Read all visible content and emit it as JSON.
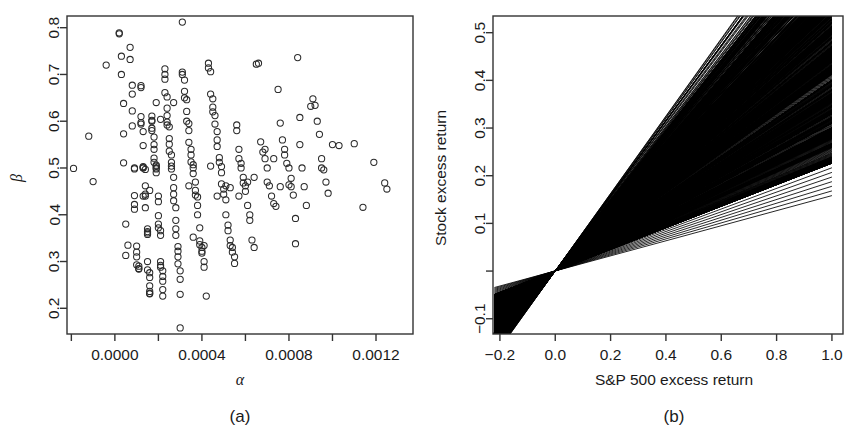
{
  "figure": {
    "background": "#ffffff",
    "ink": "#1a1a1a",
    "panels": [
      {
        "id": "a",
        "subcaption": "(a)",
        "xlabel": "α",
        "ylabel": "β",
        "xticks": [
          "0.0000",
          "0.0004",
          "0.0008",
          "0.0012"
        ],
        "yticks": [
          "0.2",
          "0.3",
          "0.4",
          "0.5",
          "0.6",
          "0.7",
          "0.8"
        ]
      },
      {
        "id": "b",
        "subcaption": "(b)",
        "xlabel": "S&P 500 excess return",
        "ylabel": "Stock excess return",
        "xticks": [
          "-0.2",
          "0.0",
          "0.2",
          "0.4",
          "0.6",
          "0.8",
          "1.0"
        ],
        "yticks": [
          "-0.1",
          "0.1",
          "0.2",
          "0.3",
          "0.4",
          "0.5"
        ]
      }
    ]
  },
  "chart_data": [
    {
      "type": "scatter",
      "panel": "(a)",
      "title": "",
      "xlabel": "α",
      "ylabel": "β",
      "xlim": [
        -0.00022,
        0.00137
      ],
      "ylim": [
        0.145,
        0.825
      ],
      "xticks": [
        0.0,
        0.0004,
        0.0008,
        0.0012
      ],
      "xtick_labels": [
        "0.0000",
        "0.0004",
        "0.0008",
        "0.0012"
      ],
      "yticks": [
        0.2,
        0.3,
        0.4,
        0.5,
        0.6,
        0.7,
        0.8
      ],
      "ytick_labels": [
        "0.2",
        "0.3",
        "0.4",
        "0.5",
        "0.6",
        "0.7",
        "0.8"
      ],
      "grid": false,
      "legend": "none",
      "marker": "open-circle",
      "n_points": 260,
      "points": [
        [
          -0.00019,
          0.499
        ],
        [
          -0.00012,
          0.568
        ],
        [
          -0.0001,
          0.471
        ],
        [
          -4e-05,
          0.72
        ],
        [
          2e-05,
          0.787
        ],
        [
          2e-05,
          0.789
        ],
        [
          3e-05,
          0.7
        ],
        [
          3e-05,
          0.739
        ],
        [
          4e-05,
          0.638
        ],
        [
          4e-05,
          0.573
        ],
        [
          4e-05,
          0.511
        ],
        [
          5e-05,
          0.38
        ],
        [
          5e-05,
          0.313
        ],
        [
          6e-05,
          0.335
        ],
        [
          7e-05,
          0.758
        ],
        [
          7e-05,
          0.732
        ],
        [
          8e-05,
          0.677
        ],
        [
          8e-05,
          0.658
        ],
        [
          8e-05,
          0.622
        ],
        [
          8e-05,
          0.59
        ],
        [
          9e-05,
          0.5
        ],
        [
          9e-05,
          0.498
        ],
        [
          9e-05,
          0.441
        ],
        [
          9e-05,
          0.422
        ],
        [
          9e-05,
          0.412
        ],
        [
          0.0001,
          0.333
        ],
        [
          0.0001,
          0.32
        ],
        [
          0.0001,
          0.31
        ],
        [
          0.0001,
          0.293
        ],
        [
          0.00011,
          0.29
        ],
        [
          0.00011,
          0.285
        ],
        [
          0.00011,
          0.284
        ],
        [
          0.00012,
          0.676
        ],
        [
          0.00012,
          0.672
        ],
        [
          0.00012,
          0.61
        ],
        [
          0.00012,
          0.597
        ],
        [
          0.00012,
          0.594
        ],
        [
          0.00013,
          0.578
        ],
        [
          0.00013,
          0.548
        ],
        [
          0.00013,
          0.503
        ],
        [
          0.00013,
          0.501
        ],
        [
          0.00013,
          0.5
        ],
        [
          0.00014,
          0.497
        ],
        [
          0.00014,
          0.462
        ],
        [
          0.00014,
          0.444
        ],
        [
          0.00014,
          0.44
        ],
        [
          0.00014,
          0.415
        ],
        [
          0.00015,
          0.37
        ],
        [
          0.00015,
          0.364
        ],
        [
          0.00015,
          0.361
        ],
        [
          0.00015,
          0.358
        ],
        [
          0.00015,
          0.3
        ],
        [
          0.00015,
          0.282
        ],
        [
          0.00016,
          0.276
        ],
        [
          0.00016,
          0.266
        ],
        [
          0.00016,
          0.248
        ],
        [
          0.00016,
          0.236
        ],
        [
          0.00016,
          0.232
        ],
        [
          0.00016,
          0.231
        ],
        [
          0.00017,
          0.611
        ],
        [
          0.00017,
          0.602
        ],
        [
          0.00017,
          0.6
        ],
        [
          0.00017,
          0.585
        ],
        [
          0.00017,
          0.58
        ],
        [
          0.00018,
          0.566
        ],
        [
          0.00018,
          0.55
        ],
        [
          0.00018,
          0.54
        ],
        [
          0.00018,
          0.521
        ],
        [
          0.00018,
          0.512
        ],
        [
          0.00019,
          0.506
        ],
        [
          0.00019,
          0.504
        ],
        [
          0.00019,
          0.5
        ],
        [
          0.00019,
          0.498
        ],
        [
          0.00019,
          0.49
        ],
        [
          0.0002,
          0.44
        ],
        [
          0.0002,
          0.428
        ],
        [
          0.0002,
          0.398
        ],
        [
          0.0002,
          0.38
        ],
        [
          0.0002,
          0.372
        ],
        [
          0.00021,
          0.366
        ],
        [
          0.00021,
          0.356
        ],
        [
          0.00021,
          0.3
        ],
        [
          0.00021,
          0.292
        ],
        [
          0.00021,
          0.288
        ],
        [
          0.00022,
          0.28
        ],
        [
          0.00022,
          0.268
        ],
        [
          0.00022,
          0.258
        ],
        [
          0.00022,
          0.24
        ],
        [
          0.00022,
          0.226
        ],
        [
          0.00023,
          0.7
        ],
        [
          0.00023,
          0.69
        ],
        [
          0.00023,
          0.712
        ],
        [
          0.00023,
          0.661
        ],
        [
          0.00024,
          0.652
        ],
        [
          0.00024,
          0.612
        ],
        [
          0.00024,
          0.598
        ],
        [
          0.00024,
          0.592
        ],
        [
          0.00025,
          0.588
        ],
        [
          0.00025,
          0.563
        ],
        [
          0.00025,
          0.551
        ],
        [
          0.00025,
          0.536
        ],
        [
          0.00026,
          0.528
        ],
        [
          0.00026,
          0.512
        ],
        [
          0.00026,
          0.504
        ],
        [
          0.00026,
          0.498
        ],
        [
          0.00027,
          0.48
        ],
        [
          0.00027,
          0.458
        ],
        [
          0.00027,
          0.444
        ],
        [
          0.00027,
          0.43
        ],
        [
          0.00028,
          0.415
        ],
        [
          0.00028,
          0.388
        ],
        [
          0.00028,
          0.37
        ],
        [
          0.00028,
          0.356
        ],
        [
          0.00029,
          0.332
        ],
        [
          0.00029,
          0.322
        ],
        [
          0.00029,
          0.31
        ],
        [
          0.00029,
          0.295
        ],
        [
          0.0003,
          0.28
        ],
        [
          0.0003,
          0.262
        ],
        [
          0.0003,
          0.23
        ],
        [
          0.00031,
          0.812
        ],
        [
          0.00031,
          0.705
        ],
        [
          0.00031,
          0.7
        ],
        [
          0.00032,
          0.688
        ],
        [
          0.00032,
          0.664
        ],
        [
          0.00032,
          0.65
        ],
        [
          0.00033,
          0.646
        ],
        [
          0.00033,
          0.621
        ],
        [
          0.00033,
          0.6
        ],
        [
          0.00034,
          0.595
        ],
        [
          0.00034,
          0.58
        ],
        [
          0.00034,
          0.555
        ],
        [
          0.00035,
          0.54
        ],
        [
          0.00035,
          0.528
        ],
        [
          0.00035,
          0.513
        ],
        [
          0.00036,
          0.507
        ],
        [
          0.00036,
          0.5
        ],
        [
          0.00036,
          0.488
        ],
        [
          0.00037,
          0.47
        ],
        [
          0.00037,
          0.452
        ],
        [
          0.00037,
          0.442
        ],
        [
          0.00038,
          0.438
        ],
        [
          0.00038,
          0.42
        ],
        [
          0.00038,
          0.4
        ],
        [
          0.00039,
          0.372
        ],
        [
          0.00039,
          0.344
        ],
        [
          0.00039,
          0.336
        ],
        [
          0.0004,
          0.33
        ],
        [
          0.0004,
          0.322
        ],
        [
          0.0004,
          0.318
        ],
        [
          0.00041,
          0.3
        ],
        [
          0.00041,
          0.288
        ],
        [
          0.00042,
          0.226
        ],
        [
          0.00043,
          0.724
        ],
        [
          0.00043,
          0.714
        ],
        [
          0.00044,
          0.706
        ],
        [
          0.00044,
          0.658
        ],
        [
          0.00045,
          0.648
        ],
        [
          0.00045,
          0.63
        ],
        [
          0.00045,
          0.62
        ],
        [
          0.00046,
          0.612
        ],
        [
          0.00046,
          0.594
        ],
        [
          0.00047,
          0.578
        ],
        [
          0.00047,
          0.56
        ],
        [
          0.00047,
          0.546
        ],
        [
          0.00048,
          0.522
        ],
        [
          0.00048,
          0.512
        ],
        [
          0.00049,
          0.503
        ],
        [
          0.00049,
          0.49
        ],
        [
          0.00049,
          0.466
        ],
        [
          0.0005,
          0.455
        ],
        [
          0.0005,
          0.444
        ],
        [
          0.00051,
          0.432
        ],
        [
          0.00051,
          0.4
        ],
        [
          0.00052,
          0.378
        ],
        [
          0.00052,
          0.366
        ],
        [
          0.00053,
          0.346
        ],
        [
          0.00053,
          0.334
        ],
        [
          0.00054,
          0.33
        ],
        [
          0.00054,
          0.32
        ],
        [
          0.00055,
          0.31
        ],
        [
          0.00055,
          0.296
        ],
        [
          0.00056,
          0.592
        ],
        [
          0.00056,
          0.58
        ],
        [
          0.00057,
          0.54
        ],
        [
          0.00057,
          0.52
        ],
        [
          0.00058,
          0.51
        ],
        [
          0.00058,
          0.5
        ],
        [
          0.00059,
          0.48
        ],
        [
          0.00059,
          0.468
        ],
        [
          0.0006,
          0.462
        ],
        [
          0.0006,
          0.45
        ],
        [
          0.00061,
          0.42
        ],
        [
          0.00062,
          0.4
        ],
        [
          0.00062,
          0.388
        ],
        [
          0.00063,
          0.346
        ],
        [
          0.00064,
          0.33
        ],
        [
          0.00065,
          0.722
        ],
        [
          0.00066,
          0.724
        ],
        [
          0.00067,
          0.556
        ],
        [
          0.00068,
          0.534
        ],
        [
          0.00069,
          0.52
        ],
        [
          0.0007,
          0.5
        ],
        [
          0.0007,
          0.47
        ],
        [
          0.00071,
          0.462
        ],
        [
          0.00072,
          0.44
        ],
        [
          0.00073,
          0.424
        ],
        [
          0.00074,
          0.418
        ],
        [
          0.00075,
          0.668
        ],
        [
          0.00076,
          0.596
        ],
        [
          0.00077,
          0.56
        ],
        [
          0.00078,
          0.54
        ],
        [
          0.00078,
          0.528
        ],
        [
          0.00079,
          0.51
        ],
        [
          0.0008,
          0.5
        ],
        [
          0.00081,
          0.478
        ],
        [
          0.00081,
          0.46
        ],
        [
          0.00082,
          0.442
        ],
        [
          0.00083,
          0.392
        ],
        [
          0.00083,
          0.338
        ],
        [
          0.00084,
          0.736
        ],
        [
          0.00085,
          0.55
        ],
        [
          0.00086,
          0.5
        ],
        [
          0.00087,
          0.46
        ],
        [
          0.00088,
          0.42
        ],
        [
          0.0009,
          0.632
        ],
        [
          0.00091,
          0.648
        ],
        [
          0.00092,
          0.634
        ],
        [
          0.00093,
          0.6
        ],
        [
          0.00094,
          0.572
        ],
        [
          0.00095,
          0.52
        ],
        [
          0.00095,
          0.5
        ],
        [
          0.00096,
          0.496
        ],
        [
          0.00097,
          0.47
        ],
        [
          0.00098,
          0.446
        ],
        [
          0.001,
          0.55
        ],
        [
          0.00103,
          0.548
        ],
        [
          0.0011,
          0.552
        ],
        [
          0.00114,
          0.416
        ],
        [
          0.00119,
          0.512
        ],
        [
          0.00124,
          0.468
        ],
        [
          0.00125,
          0.455
        ],
        [
          0.0003,
          0.158
        ],
        [
          0.00019,
          0.64
        ],
        [
          0.00021,
          0.604
        ],
        [
          0.00024,
          0.628
        ],
        [
          0.00027,
          0.64
        ],
        [
          0.00013,
          0.44
        ],
        [
          0.00016,
          0.452
        ],
        [
          0.00034,
          0.462
        ],
        [
          0.00036,
          0.352
        ],
        [
          0.00041,
          0.334
        ],
        [
          0.00044,
          0.504
        ],
        [
          0.00047,
          0.44
        ],
        [
          0.00051,
          0.462
        ],
        [
          0.00053,
          0.458
        ],
        [
          0.00057,
          0.44
        ],
        [
          0.00061,
          0.47
        ],
        [
          0.00064,
          0.48
        ],
        [
          0.00069,
          0.54
        ],
        [
          0.00073,
          0.52
        ],
        [
          0.00076,
          0.46
        ],
        [
          0.0008,
          0.464
        ],
        [
          0.00085,
          0.608
        ]
      ]
    },
    {
      "type": "line",
      "panel": "(b)",
      "title": "",
      "xlabel": "S&P 500 excess return",
      "ylabel": "Stock excess return",
      "xlim": [
        -0.225,
        1.04
      ],
      "ylim": [
        -0.132,
        0.535
      ],
      "xticks": [
        -0.2,
        0.0,
        0.2,
        0.4,
        0.6,
        0.8,
        1.0
      ],
      "xtick_labels": [
        "-0.2",
        "0.0",
        "0.2",
        "0.4",
        "0.6",
        "0.8",
        "1.0"
      ],
      "yticks": [
        -0.1,
        0.0,
        0.1,
        0.2,
        0.3,
        0.4,
        0.5
      ],
      "ytick_labels": [
        "-0.1",
        "",
        "0.1",
        "0.2",
        "0.3",
        "0.4",
        "0.5"
      ],
      "grid": false,
      "legend": "none",
      "description": "Fan of ~260 fitted security characteristic lines y = alpha + beta*x, all nearly intersecting at the origin.",
      "n_lines": 260,
      "intercept_range": [
        0.0,
        0.0013
      ],
      "slope_range": [
        0.15,
        0.82
      ],
      "slope_note": "Line slopes equal the beta values of panel (a); intercepts equal the alpha values."
    }
  ]
}
